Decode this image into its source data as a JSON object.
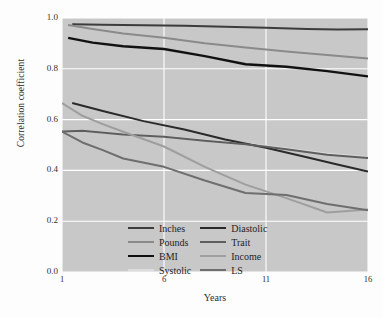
{
  "chart_data": {
    "type": "line",
    "title": "",
    "xlabel": "Years",
    "ylabel": "Correlation coefficient",
    "xlim": [
      1,
      16
    ],
    "ylim": [
      0.0,
      1.0
    ],
    "xticks": [
      "1",
      "6",
      "11",
      "16"
    ],
    "xtick_values": [
      1,
      6,
      11,
      16
    ],
    "yticks": [
      "0.0",
      "0.2",
      "0.4",
      "0.6",
      "0.8",
      "1.0"
    ],
    "ytick_values": [
      0.0,
      0.2,
      0.4,
      0.6,
      0.8,
      1.0
    ],
    "grid": true,
    "grid_color": "#ffffff",
    "plot_background": "#c8c8c8",
    "figure_background": "#fdfdfd",
    "legend_position": "lower-left",
    "legend_columns": 2,
    "x": [
      1,
      2,
      3,
      4,
      5,
      6,
      7,
      8,
      9,
      10,
      11,
      12,
      13,
      14,
      15,
      16
    ],
    "series": [
      {
        "name": "Inches",
        "color": "#3c3c3c",
        "width": 2.0,
        "x": [
          1.5,
          3,
          5,
          7,
          9,
          11,
          13,
          14.5,
          16
        ],
        "values": [
          0.975,
          0.973,
          0.971,
          0.969,
          0.966,
          0.962,
          0.957,
          0.955,
          0.956
        ]
      },
      {
        "name": "Pounds",
        "color": "#8a8a8a",
        "width": 2.0,
        "x": [
          1.3,
          2.5,
          4,
          6,
          8,
          10,
          12,
          14,
          16
        ],
        "values": [
          0.972,
          0.957,
          0.939,
          0.922,
          0.901,
          0.884,
          0.868,
          0.854,
          0.841
        ]
      },
      {
        "name": "BMI",
        "color": "#111111",
        "width": 2.4,
        "x": [
          1.3,
          2.5,
          4,
          6,
          8,
          10,
          12,
          14,
          16
        ],
        "values": [
          0.922,
          0.903,
          0.889,
          0.878,
          0.85,
          0.818,
          0.808,
          0.791,
          0.77
        ]
      },
      {
        "name": "Systolic",
        "color": "#dcdcdc",
        "width": 1.8,
        "x": [
          1,
          2,
          4,
          6,
          8,
          10,
          12,
          14,
          16
        ],
        "values": [
          0.555,
          0.557,
          0.543,
          0.534,
          0.519,
          0.506,
          0.487,
          0.466,
          0.452
        ]
      },
      {
        "name": "Diastolic",
        "color": "#2a2a2a",
        "width": 2.0,
        "x": [
          1.5,
          3,
          5,
          7,
          9,
          11,
          13,
          14.5,
          16
        ],
        "values": [
          0.665,
          0.634,
          0.594,
          0.561,
          0.522,
          0.489,
          0.452,
          0.423,
          0.396
        ]
      },
      {
        "name": "Trait",
        "color": "#5e5e5e",
        "width": 2.0,
        "x": [
          1,
          2,
          4,
          6,
          8,
          10,
          12,
          14,
          16
        ],
        "values": [
          0.553,
          0.556,
          0.541,
          0.532,
          0.517,
          0.503,
          0.483,
          0.462,
          0.449
        ]
      },
      {
        "name": "Income",
        "color": "#9e9e9e",
        "width": 2.0,
        "x": [
          1,
          2,
          3,
          4,
          6,
          8,
          10,
          12,
          14,
          16
        ],
        "values": [
          0.665,
          0.615,
          0.582,
          0.552,
          0.494,
          0.414,
          0.344,
          0.291,
          0.234,
          0.246
        ]
      },
      {
        "name": "LS",
        "color": "#6e6e6e",
        "width": 2.0,
        "x": [
          1,
          2,
          3,
          4,
          6,
          8,
          10,
          12,
          14,
          16
        ],
        "values": [
          0.553,
          0.51,
          0.48,
          0.447,
          0.414,
          0.36,
          0.311,
          0.303,
          0.268,
          0.243
        ]
      }
    ]
  },
  "legend": {
    "columns": [
      {
        "entries": [
          {
            "label": "Inches",
            "color": "#3c3c3c"
          },
          {
            "label": "Pounds",
            "color": "#8a8a8a"
          },
          {
            "label": "BMI",
            "color": "#111111"
          },
          {
            "label": "Systolic",
            "color": "#dcdcdc"
          }
        ]
      },
      {
        "entries": [
          {
            "label": "Diastolic",
            "color": "#2a2a2a"
          },
          {
            "label": "Trait",
            "color": "#5e5e5e"
          },
          {
            "label": "Income",
            "color": "#9e9e9e"
          },
          {
            "label": "LS",
            "color": "#6e6e6e"
          }
        ]
      }
    ]
  }
}
